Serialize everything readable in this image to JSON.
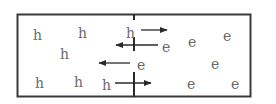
{
  "diagram": {
    "colors": {
      "frame": "#3a3a3a",
      "text": "#6a6a6a",
      "arrow": "#2a2a2a"
    },
    "holes": [
      {
        "label": "h",
        "x": 37,
        "y": 36
      },
      {
        "label": "h",
        "x": 82,
        "y": 34
      },
      {
        "label": "h",
        "x": 130,
        "y": 34
      },
      {
        "label": "h",
        "x": 64,
        "y": 55
      },
      {
        "label": "h",
        "x": 39,
        "y": 84
      },
      {
        "label": "h",
        "x": 78,
        "y": 83
      },
      {
        "label": "h",
        "x": 106,
        "y": 86
      }
    ],
    "electrons": [
      {
        "label": "e",
        "x": 166,
        "y": 48
      },
      {
        "label": "e",
        "x": 192,
        "y": 43
      },
      {
        "label": "e",
        "x": 227,
        "y": 37
      },
      {
        "label": "e",
        "x": 141,
        "y": 66
      },
      {
        "label": "e",
        "x": 215,
        "y": 65
      },
      {
        "label": "e",
        "x": 191,
        "y": 85
      },
      {
        "label": "e",
        "x": 235,
        "y": 85
      }
    ],
    "arrows": [
      {
        "from": [
          141,
          30
        ],
        "to": [
          167,
          30
        ],
        "dir": "right"
      },
      {
        "from": [
          158,
          45
        ],
        "to": [
          117,
          45
        ],
        "dir": "left"
      },
      {
        "from": [
          130,
          63
        ],
        "to": [
          100,
          63
        ],
        "dir": "left"
      },
      {
        "from": [
          115,
          83
        ],
        "to": [
          150,
          83
        ],
        "dir": "right"
      }
    ]
  }
}
